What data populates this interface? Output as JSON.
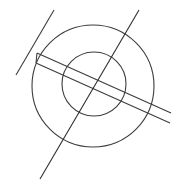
{
  "figure": {
    "canvas": {
      "width": 176,
      "height": 184,
      "background": "#ffffff"
    },
    "style": {
      "stroke_color": "#3c3c3c",
      "stroke_color_dark": "#2e2e2e",
      "stroke_width": 1.1,
      "fill": "none"
    },
    "shapes": [
      {
        "id": "outer-circle",
        "name": "outer-circle",
        "type": "circle",
        "cx": 93,
        "cy": 86,
        "r": 61,
        "stroke": "#3c3c3c",
        "stroke_width": 1.1
      },
      {
        "id": "inner-circle",
        "name": "inner-circle",
        "type": "circle",
        "cx": 94,
        "cy": 84,
        "r": 32,
        "stroke": "#3c3c3c",
        "stroke_width": 1.1
      },
      {
        "id": "band-line-upper",
        "name": "band-line-upper",
        "type": "line",
        "x1": 37,
        "y1": 53,
        "x2": 171,
        "y2": 113,
        "stroke": "#3c3c3c",
        "stroke_width": 1.1
      },
      {
        "id": "band-line-lower",
        "name": "band-line-lower",
        "type": "line",
        "x1": 36,
        "y1": 63,
        "x2": 170,
        "y2": 123,
        "stroke": "#3c3c3c",
        "stroke_width": 1.1
      },
      {
        "id": "band-cap-left",
        "name": "band-cap-left",
        "type": "line",
        "x1": 37,
        "y1": 53,
        "x2": 36,
        "y2": 63,
        "stroke": "#3c3c3c",
        "stroke_width": 1.1
      },
      {
        "id": "diagonal-long",
        "name": "diagonal-long",
        "type": "line",
        "x1": 139,
        "y1": 10,
        "x2": 40,
        "y2": 179,
        "stroke": "#2e2e2e",
        "stroke_width": 1.1
      },
      {
        "id": "diagonal-short",
        "name": "diagonal-short",
        "type": "line",
        "x1": 54,
        "y1": 10,
        "x2": 16,
        "y2": 75,
        "stroke": "#3c3c3c",
        "stroke_width": 1.1
      }
    ]
  }
}
